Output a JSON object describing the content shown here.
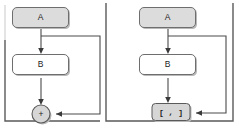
{
  "figure": {
    "background_color": "#ffffff",
    "panels": [
      {
        "id": "left-panel",
        "name": "additive-skip-connection-diagram",
        "merge_type": "sum",
        "nodes": [
          {
            "id": "a",
            "label": "A",
            "shape": "rounded-rect",
            "fill": "#dcdcdc",
            "stroke": "#6e6e6e"
          },
          {
            "id": "b",
            "label": "B",
            "shape": "rounded-rect",
            "fill": "#ffffff",
            "stroke": "#6e6e6e"
          },
          {
            "id": "merge",
            "label": "+",
            "shape": "circle",
            "fill": "#d6d6d6",
            "stroke": "#5a5a5a"
          }
        ],
        "edges": [
          {
            "from": "a",
            "to": "b",
            "kind": "straight"
          },
          {
            "from": "b",
            "to": "merge",
            "kind": "straight"
          },
          {
            "from": "a",
            "to": "merge",
            "kind": "skip"
          }
        ]
      },
      {
        "id": "right-panel",
        "name": "concatenation-skip-connection-diagram",
        "merge_type": "concat",
        "nodes": [
          {
            "id": "a",
            "label": "A",
            "shape": "rounded-rect",
            "fill": "#dcdcdc",
            "stroke": "#6e6e6e"
          },
          {
            "id": "b",
            "label": "B",
            "shape": "rounded-rect",
            "fill": "#ffffff",
            "stroke": "#6e6e6e"
          },
          {
            "id": "merge",
            "label": "[ , ]",
            "shape": "rounded-rect",
            "fill": "#d6d6d6",
            "stroke": "#5a5a5a"
          }
        ],
        "edges": [
          {
            "from": "a",
            "to": "b",
            "kind": "straight"
          },
          {
            "from": "b",
            "to": "merge",
            "kind": "straight"
          },
          {
            "from": "a",
            "to": "merge",
            "kind": "skip"
          }
        ]
      }
    ],
    "colors": {
      "node_fill_shaded": "#dcdcdc",
      "node_fill_plain": "#ffffff",
      "node_stroke": "#6e6e6e",
      "edge_stroke": "#4a4a4a",
      "frame_stroke": "#5a5a5a",
      "text": "#1d1d1d"
    }
  }
}
